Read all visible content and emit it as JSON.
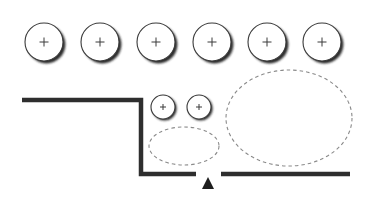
{
  "colors": {
    "background": "#ffffff",
    "wall": "#2e2e2e",
    "circle_stroke": "#3a3a3a",
    "circle_shadow": "#2a2a2a",
    "dashed": "#8a8a8a",
    "marker": "#1e1e1e"
  },
  "large_circles": [
    {
      "cx": 44,
      "cy": 42,
      "r": 19,
      "symbol": "+"
    },
    {
      "cx": 100,
      "cy": 42,
      "r": 19,
      "symbol": "+"
    },
    {
      "cx": 156,
      "cy": 42,
      "r": 19,
      "symbol": "+"
    },
    {
      "cx": 212,
      "cy": 42,
      "r": 19,
      "symbol": "+"
    },
    {
      "cx": 267,
      "cy": 42,
      "r": 19,
      "symbol": "+"
    },
    {
      "cx": 322,
      "cy": 42,
      "r": 19,
      "symbol": "+"
    }
  ],
  "small_circles": [
    {
      "cx": 163,
      "cy": 107,
      "r": 12,
      "symbol": "+"
    },
    {
      "cx": 199,
      "cy": 107,
      "r": 12,
      "symbol": "+"
    }
  ],
  "dashed_ellipses": [
    {
      "cx": 184,
      "cy": 146,
      "rx": 35,
      "ry": 19
    },
    {
      "cx": 289,
      "cy": 118,
      "rx": 63,
      "ry": 48
    }
  ],
  "walls": [
    {
      "points": "22,100 141,100 141,174 196,174"
    },
    {
      "points": "221,174 350,174"
    }
  ],
  "marker": {
    "points": "202,189 214,189 208,177",
    "symbol": "triangle-up"
  }
}
